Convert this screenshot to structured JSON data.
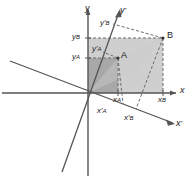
{
  "figure": {
    "type": "coordinate-transformation-diagram",
    "background": "#ffffff"
  },
  "colors": {
    "axis": "#555555",
    "inner_rect_fill": "#a8a8a8",
    "outer_rect_fill": "#cfcfcf",
    "dashed": "#6b6b6b",
    "text": "#1a1a1a"
  },
  "axes": [
    {
      "name": "x-axis",
      "label": "x",
      "prime": false,
      "orientation": "horizontal"
    },
    {
      "name": "y-axis",
      "label": "y",
      "prime": false,
      "orientation": "vertical"
    },
    {
      "name": "x-prime-axis",
      "label": "x",
      "prime": true,
      "orientation": "rotated-down-right"
    },
    {
      "name": "y-prime-axis",
      "label": "y",
      "prime": true,
      "orientation": "rotated-up-right"
    }
  ],
  "points": [
    {
      "name": "point-A",
      "label": "A",
      "x": 118,
      "y": 58
    },
    {
      "name": "point-B",
      "label": "B",
      "x": 163,
      "y": 38
    }
  ],
  "tick_labels": [
    {
      "name": "tick-y-B",
      "base": "y",
      "sub": "B",
      "prime": false,
      "axis": "y"
    },
    {
      "name": "tick-y-A",
      "base": "y",
      "sub": "A",
      "prime": false,
      "axis": "y"
    },
    {
      "name": "tick-y-prime-B",
      "base": "y",
      "sub": "B",
      "prime": true,
      "axis": "y'"
    },
    {
      "name": "tick-y-prime-A",
      "base": "y",
      "sub": "A",
      "prime": true,
      "axis": "y'"
    },
    {
      "name": "tick-x-A",
      "base": "x",
      "sub": "A",
      "prime": false,
      "axis": "x"
    },
    {
      "name": "tick-x-B",
      "base": "x",
      "sub": "B",
      "prime": false,
      "axis": "x"
    },
    {
      "name": "tick-x-prime-A",
      "base": "x",
      "sub": "A",
      "prime": true,
      "axis": "x'"
    },
    {
      "name": "tick-x-prime-B",
      "base": "x",
      "sub": "B",
      "prime": true,
      "axis": "x'"
    }
  ],
  "labels": {
    "x_axis": "x",
    "y_axis": "y",
    "x_prime_axis": "x",
    "y_prime_axis": "y",
    "prime_mark": "'",
    "point_a": "A",
    "point_b": "B",
    "base_x": "x",
    "base_y": "y",
    "sub_a": "A",
    "sub_b": "B"
  }
}
